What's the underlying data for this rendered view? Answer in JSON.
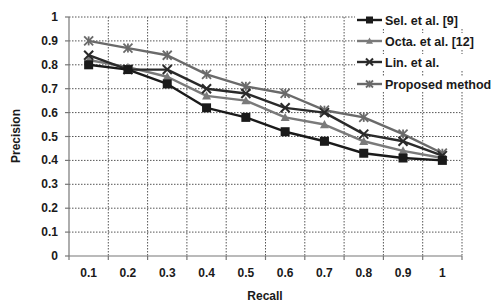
{
  "chart_data": {
    "type": "line",
    "title": "",
    "xlabel": "Recall",
    "ylabel": "Precision",
    "categories": [
      "0.1",
      "0.2",
      "0.3",
      "0.4",
      "0.5",
      "0.6",
      "0.7",
      "0.8",
      "0.9",
      "1"
    ],
    "y_ticks": [
      "0",
      "0.1",
      "0.2",
      "0.3",
      "0.4",
      "0.5",
      "0.6",
      "0.7",
      "0.8",
      "0.9",
      "1"
    ],
    "ylim": [
      0,
      1
    ],
    "grid": true,
    "legend_position": "top-right",
    "series": [
      {
        "name": "Sel. et al. [9]",
        "marker": "square",
        "color": "#1a1a1a",
        "values": [
          0.8,
          0.78,
          0.72,
          0.62,
          0.58,
          0.52,
          0.48,
          0.43,
          0.41,
          0.4
        ]
      },
      {
        "name": "Octa. et al. [12]",
        "marker": "triangle",
        "color": "#7a7a7a",
        "values": [
          0.82,
          0.79,
          0.75,
          0.67,
          0.65,
          0.58,
          0.55,
          0.48,
          0.44,
          0.41
        ]
      },
      {
        "name": "Lin. et al.",
        "marker": "x",
        "color": "#2a2a2a",
        "values": [
          0.84,
          0.78,
          0.78,
          0.7,
          0.68,
          0.62,
          0.6,
          0.51,
          0.48,
          0.42
        ]
      },
      {
        "name": "Proposed method",
        "marker": "star",
        "color": "#6a6a6a",
        "values": [
          0.9,
          0.87,
          0.84,
          0.76,
          0.71,
          0.68,
          0.61,
          0.58,
          0.51,
          0.43
        ]
      }
    ]
  }
}
